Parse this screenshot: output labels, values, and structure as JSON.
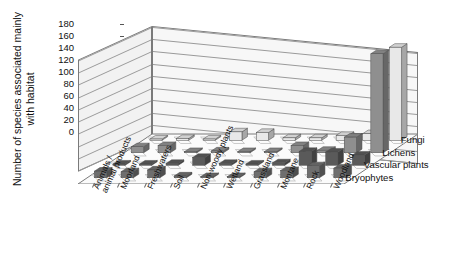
{
  "chart_data": {
    "type": "bar",
    "subtype": "3d-grouped-bar",
    "title": "",
    "xlabel": "",
    "ylabel": "Number of species associated mainly with habitat",
    "zlabel": "",
    "ylim": [
      0,
      180
    ],
    "yticks": [
      0,
      20,
      40,
      60,
      80,
      100,
      120,
      140,
      160,
      180
    ],
    "grid": true,
    "legend_position": "right",
    "categories": [
      "Animals / animal products",
      "Moorland",
      "Freshwaters",
      "Soil",
      "Non-woody plants",
      "Wetland",
      "Grassland",
      "Montane",
      "Rock",
      "Woodland"
    ],
    "series": [
      {
        "name": "Fungi",
        "color": "#e8e8e8",
        "values": [
          2,
          3,
          2,
          14,
          13,
          4,
          4,
          8,
          11,
          155
        ]
      },
      {
        "name": "Lichens",
        "color": "#8f8f8f",
        "values": [
          10,
          12,
          2,
          3,
          2,
          2,
          12,
          4,
          26,
          165
        ]
      },
      {
        "name": "Vascular plants",
        "color": "#5a5a5a",
        "values": [
          2,
          2,
          3,
          13,
          3,
          2,
          4,
          23,
          22,
          17
        ]
      },
      {
        "name": "Bryophytes",
        "color": "#6e6e6e",
        "values": [
          11,
          10,
          13,
          3,
          2,
          2,
          10,
          12,
          20,
          16
        ]
      }
    ]
  },
  "axis": {
    "y_title": "Number of species associated mainly with habitat",
    "tick_labels": [
      "180",
      "160",
      "140",
      "120",
      "100",
      "80",
      "60",
      "40",
      "20",
      "0"
    ]
  },
  "legend": {
    "items": [
      "Fungi",
      "Lichens",
      "Vascular plants",
      "Bryophytes"
    ]
  },
  "xaxis": {
    "labels": [
      "Animals /",
      "animal products",
      "Moorland",
      "Freshwaters",
      "Soil",
      "Non-woody plants",
      "Wetland",
      "Grassland",
      "Montane",
      "Rock",
      "Woodland"
    ]
  },
  "colors": {
    "fungi": "#e8e8e8",
    "lichens": "#8f8f8f",
    "vascular_plants": "#5a5a5a",
    "bryophytes": "#6e6e6e",
    "wall": "#f7f7f7",
    "gridline": "#9a9a9a",
    "axis": "#555555"
  }
}
